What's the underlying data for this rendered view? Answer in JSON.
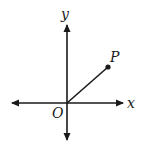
{
  "diagram": {
    "type": "coordinate-plane",
    "axes": {
      "x_label": "x",
      "y_label": "y",
      "origin_label": "O",
      "arrows": [
        "left",
        "right",
        "up",
        "down"
      ]
    },
    "point": {
      "label": "P",
      "quadrant": "I",
      "segment_from": "O"
    },
    "colors": {
      "stroke": "#1a1a1a",
      "background": "#ffffff"
    }
  }
}
